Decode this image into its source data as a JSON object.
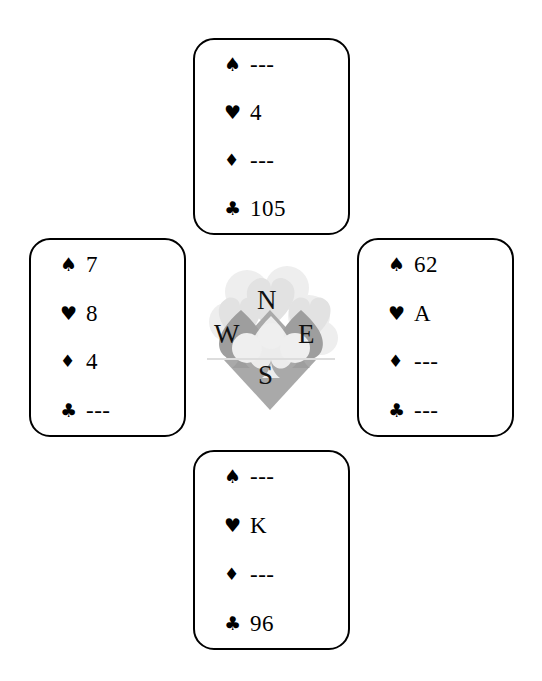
{
  "diagram": {
    "background_color": "#ffffff",
    "ink_color": "#000000",
    "void_marker": "---"
  },
  "suits": {
    "spade": {
      "name": "spade-suit",
      "glyph": "♠",
      "label": "Spades"
    },
    "heart": {
      "name": "heart-suit",
      "glyph": "♥",
      "label": "Hearts"
    },
    "diamond": {
      "name": "diamond-suit",
      "glyph": "♦",
      "label": "Diamonds"
    },
    "club": {
      "name": "club-suit",
      "glyph": "♣",
      "label": "Clubs"
    }
  },
  "compass": {
    "north": "N",
    "west": "W",
    "east": "E",
    "south": "S",
    "watermark": {
      "name": "card-suits-watermark",
      "light_gray": "#e4e4e4",
      "mid_gray": "#a9a9a9",
      "pale_gray": "#f0f0f0"
    }
  },
  "hands": {
    "north": {
      "seat": "North",
      "spades": "---",
      "hearts": "4",
      "diamonds": "---",
      "clubs": "105"
    },
    "west": {
      "seat": "West",
      "spades": "7",
      "hearts": "8",
      "diamonds": "4",
      "clubs": "---"
    },
    "east": {
      "seat": "East",
      "spades": "62",
      "hearts": "A",
      "diamonds": "---",
      "clubs": "---"
    },
    "south": {
      "seat": "South",
      "spades": "---",
      "hearts": "K",
      "diamonds": "---",
      "clubs": "96"
    }
  }
}
